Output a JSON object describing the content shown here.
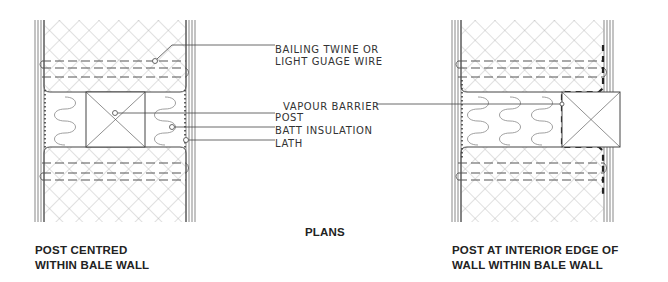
{
  "heading": "PLANS",
  "left_detail": {
    "title_line1": "POST CENTRED",
    "title_line2": "WITHIN BALE WALL"
  },
  "right_detail": {
    "title_line1": "POST AT INTERIOR EDGE OF",
    "title_line2": "WALL WITHIN BALE WALL"
  },
  "callouts": {
    "twine_line1": "BAILING TWINE OR",
    "twine_line2": "LIGHT GUAGE WIRE",
    "vapour_barrier": "VAPOUR BARRIER",
    "post": "POST",
    "batt": "BATT INSULATION",
    "lath": "LATH"
  },
  "colors": {
    "line": "#444444",
    "hatch": "#9a9a9a",
    "text": "#333333"
  }
}
